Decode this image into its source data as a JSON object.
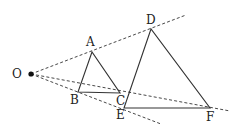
{
  "diagram": {
    "type": "geometry-homothety",
    "points": {
      "O": {
        "label": "O",
        "x": 31,
        "y": 74,
        "lx": 12,
        "ly": 78
      },
      "A": {
        "label": "A",
        "x": 92,
        "y": 52,
        "lx": 86,
        "ly": 46
      },
      "B": {
        "label": "B",
        "x": 78,
        "y": 92,
        "lx": 70,
        "ly": 104
      },
      "C": {
        "label": "C",
        "x": 120,
        "y": 93,
        "lx": 116,
        "ly": 105
      },
      "D": {
        "label": "D",
        "x": 151,
        "y": 29,
        "lx": 146,
        "ly": 24
      },
      "E": {
        "label": "E",
        "x": 124,
        "y": 108,
        "lx": 116,
        "ly": 119
      },
      "F": {
        "label": "F",
        "x": 210,
        "y": 108,
        "lx": 206,
        "ly": 121
      }
    },
    "triangles": [
      [
        "A",
        "B",
        "C"
      ],
      [
        "D",
        "E",
        "F"
      ]
    ],
    "dashed_rays": [
      {
        "from": "O",
        "through": "A",
        "end": [
          186,
          15
        ]
      },
      {
        "from": "O",
        "through": "C",
        "end": [
          230,
          111
        ]
      },
      {
        "from": "O",
        "through": "B",
        "end": [
          161,
          124
        ]
      }
    ]
  }
}
